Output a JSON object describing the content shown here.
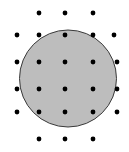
{
  "diagram": {
    "circle": {
      "cx": 68,
      "cy": 78.5,
      "r": 48.5,
      "fill": "#bdbdbd",
      "stroke": "#3a3a3a"
    },
    "dot_color": "#000000",
    "dot_radius": 2.4,
    "dots": [
      {
        "x": 39,
        "y": 13
      },
      {
        "x": 65,
        "y": 13
      },
      {
        "x": 93,
        "y": 13
      },
      {
        "x": 17,
        "y": 35
      },
      {
        "x": 39,
        "y": 35
      },
      {
        "x": 65,
        "y": 35
      },
      {
        "x": 93,
        "y": 35
      },
      {
        "x": 114,
        "y": 35
      },
      {
        "x": 17,
        "y": 62
      },
      {
        "x": 39,
        "y": 62
      },
      {
        "x": 65,
        "y": 62
      },
      {
        "x": 93,
        "y": 62
      },
      {
        "x": 117,
        "y": 62
      },
      {
        "x": 17,
        "y": 89
      },
      {
        "x": 39,
        "y": 89
      },
      {
        "x": 65,
        "y": 89
      },
      {
        "x": 93,
        "y": 89
      },
      {
        "x": 117,
        "y": 89
      },
      {
        "x": 17,
        "y": 112
      },
      {
        "x": 39,
        "y": 112
      },
      {
        "x": 65,
        "y": 112
      },
      {
        "x": 93,
        "y": 112
      },
      {
        "x": 117,
        "y": 112
      },
      {
        "x": 39,
        "y": 139
      },
      {
        "x": 65,
        "y": 139
      },
      {
        "x": 93,
        "y": 139
      }
    ]
  }
}
